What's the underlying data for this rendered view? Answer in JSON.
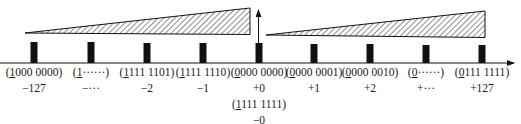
{
  "diagram": {
    "title": "",
    "axis": {
      "direction": "right",
      "has_arrow": true
    },
    "zero_arrow": {
      "direction": "up"
    },
    "hatched_regions": [
      {
        "side": "negative",
        "meaning": "magnitude increases toward -127"
      },
      {
        "side": "positive",
        "meaning": "magnitude increases toward +127"
      }
    ],
    "points": [
      {
        "sign_bit": "1",
        "rest": "000 0000",
        "value": "−127"
      },
      {
        "sign_bit": "1",
        "rest": "······",
        "value": "−···"
      },
      {
        "sign_bit": "1",
        "rest": "111 1101",
        "value": "−2"
      },
      {
        "sign_bit": "1",
        "rest": "111 1110",
        "value": "−1"
      },
      {
        "sign_bit": "0",
        "rest": "000 0000",
        "value": "+0",
        "alt_sign_bit": "1",
        "alt_rest": "111 1111",
        "alt_value": "−0"
      },
      {
        "sign_bit": "0",
        "rest": "000 0001",
        "value": "+1"
      },
      {
        "sign_bit": "0",
        "rest": "000 0010",
        "value": "+2"
      },
      {
        "sign_bit": "0",
        "rest": "······",
        "value": "+···"
      },
      {
        "sign_bit": "0",
        "rest": "111 1111",
        "value": "+127"
      }
    ],
    "colors": {
      "ink": "#111111",
      "background": "#ffffff"
    }
  }
}
